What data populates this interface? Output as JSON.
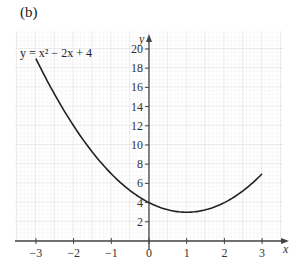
{
  "panel_label": "(b)",
  "chart_data": {
    "type": "line",
    "title": "",
    "xlabel": "x",
    "ylabel": "y",
    "equation_label": "y = x² − 2x + 4",
    "xlim": [
      -3.5,
      3.6
    ],
    "ylim": [
      0,
      21
    ],
    "grid": true,
    "x_ticks": [
      -3,
      -2,
      -1,
      0,
      1,
      2,
      3
    ],
    "x_tick_labels": [
      "−3",
      "−2",
      "−1",
      "0",
      "1",
      "2",
      "3"
    ],
    "y_ticks": [
      2,
      4,
      6,
      8,
      10,
      12,
      14,
      16,
      18,
      20
    ],
    "y_tick_labels": [
      "2",
      "4",
      "6",
      "8",
      "10",
      "12",
      "14",
      "16",
      "18",
      "20"
    ],
    "series": [
      {
        "name": "y = x² − 2x + 4",
        "x": [
          -3,
          -2.5,
          -2,
          -1.5,
          -1,
          -0.5,
          0,
          0.5,
          1,
          1.5,
          2,
          2.5,
          3
        ],
        "y": [
          19,
          15.25,
          12,
          9.25,
          7,
          5.25,
          4,
          3.25,
          3,
          3.25,
          4,
          5.25,
          7
        ]
      }
    ],
    "colors": {
      "curve": "#222222",
      "axis": "#444444",
      "grid_minor": "#e2e2e2",
      "grid_major": "#c8c8c8"
    }
  }
}
